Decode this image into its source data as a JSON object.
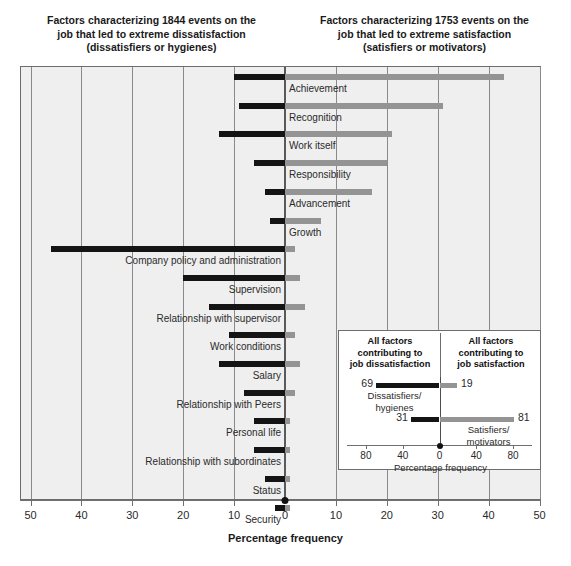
{
  "titles": {
    "left": "Factors characterizing 1844 events on the job that led to extreme dissatisfaction (dissatisfiers or hygienes)",
    "left_l1": "Factors characterizing 1844 events on the",
    "left_l2": "job that led to extreme dissatisfaction",
    "left_l3": "(dissatisfiers or hygienes)",
    "right_l1": "Factors characterizing 1753 events on the",
    "right_l2": "job that led to extreme satisfaction",
    "right_l3": "(satisfiers or motivators)"
  },
  "axis": {
    "title": "Percentage frequency",
    "ticks": [
      "50",
      "40",
      "30",
      "20",
      "10",
      "0",
      "10",
      "20",
      "30",
      "40",
      "50"
    ],
    "tick_values": [
      -50,
      -40,
      -30,
      -20,
      -10,
      0,
      10,
      20,
      30,
      40,
      50
    ]
  },
  "inset": {
    "header_left_l1": "All factors",
    "header_left_l2": "contributing to",
    "header_left_l3": "job dissatisfaction",
    "header_right_l1": "All factors",
    "header_right_l2": "contributing to",
    "header_right_l3": "job satisfaction",
    "axis_title": "Percentage frequency",
    "ticks": [
      "80",
      "40",
      "0",
      "40",
      "80"
    ],
    "tick_values": [
      -80,
      -40,
      0,
      40,
      80
    ],
    "rows": [
      {
        "caption_l1": "Dissatisfiers/",
        "caption_l2": "hygienes",
        "neg": 69,
        "pos": 19,
        "neg_label": "69",
        "pos_label": "19"
      },
      {
        "caption_l1": "Satisfiers/",
        "caption_l2": "motivators",
        "neg": 31,
        "pos": 81,
        "neg_label": "31",
        "pos_label": "81"
      }
    ]
  },
  "colors": {
    "negative_bar": "#141414",
    "positive_bar": "#949494",
    "plot_background": "#efefef",
    "frame": "#6d6d6d",
    "gridline": "#8a8a8a",
    "inset_background": "#ffffff"
  },
  "chart_data": {
    "type": "bar",
    "subtitle": "Factors characterizing 1844 events leading to extreme dissatisfaction and 1753 events leading to extreme satisfaction",
    "xlabel": "Percentage frequency",
    "ylabel": "",
    "xlim": [
      -50,
      50
    ],
    "grid": true,
    "legend_position": "none",
    "orientation": "horizontal-diverging",
    "categories": [
      "Achievement",
      "Recognition",
      "Work itself",
      "Responsibility",
      "Advancement",
      "Growth",
      "Company policy and administration",
      "Supervision",
      "Relationship with supervisor",
      "Work conditions",
      "Salary",
      "Relationship with Peers",
      "Personal life",
      "Relationship with subordinates",
      "Status",
      "Security"
    ],
    "series": [
      {
        "name": "Dissatisfaction (hygienes)",
        "color": "#141414",
        "direction": "left",
        "values": [
          10,
          9,
          13,
          6,
          4,
          3,
          46,
          20,
          15,
          11,
          13,
          8,
          6,
          6,
          4,
          2
        ]
      },
      {
        "name": "Satisfaction (motivators)",
        "color": "#949494",
        "direction": "right",
        "values": [
          43,
          31,
          21,
          20,
          17,
          7,
          2,
          3,
          4,
          2,
          3,
          2,
          1,
          1,
          1,
          1
        ]
      }
    ],
    "inset": {
      "type": "bar",
      "title_left": "All factors contributing to job dissatisfaction",
      "title_right": "All factors contributing to job satisfaction",
      "xlabel": "Percentage frequency",
      "xlim": [
        -100,
        100
      ],
      "categories": [
        "Dissatisfiers/hygienes",
        "Satisfiers/motivators"
      ],
      "series": [
        {
          "name": "Dissatisfaction",
          "direction": "left",
          "color": "#141414",
          "values": [
            69,
            31
          ]
        },
        {
          "name": "Satisfaction",
          "direction": "right",
          "color": "#949494",
          "values": [
            19,
            81
          ]
        }
      ]
    }
  },
  "rows": [
    {
      "label": "Achievement",
      "neg": 10,
      "pos": 43,
      "label_side": "right"
    },
    {
      "label": "Recognition",
      "neg": 9,
      "pos": 31,
      "label_side": "right"
    },
    {
      "label": "Work itself",
      "neg": 13,
      "pos": 21,
      "label_side": "right"
    },
    {
      "label": "Responsibility",
      "neg": 6,
      "pos": 20,
      "label_side": "right"
    },
    {
      "label": "Advancement",
      "neg": 4,
      "pos": 17,
      "label_side": "right"
    },
    {
      "label": "Growth",
      "neg": 3,
      "pos": 7,
      "label_side": "right"
    },
    {
      "label": "Company policy and administration",
      "neg": 46,
      "pos": 2,
      "label_side": "left"
    },
    {
      "label": "Supervision",
      "neg": 20,
      "pos": 3,
      "label_side": "left"
    },
    {
      "label": "Relationship with supervisor",
      "neg": 15,
      "pos": 4,
      "label_side": "left"
    },
    {
      "label": "Work conditions",
      "neg": 11,
      "pos": 2,
      "label_side": "left"
    },
    {
      "label": "Salary",
      "neg": 13,
      "pos": 3,
      "label_side": "left"
    },
    {
      "label": "Relationship with Peers",
      "neg": 8,
      "pos": 2,
      "label_side": "left"
    },
    {
      "label": "Personal life",
      "neg": 6,
      "pos": 1,
      "label_side": "left"
    },
    {
      "label": "Relationship with subordinates",
      "neg": 6,
      "pos": 1,
      "label_side": "left"
    },
    {
      "label": "Status",
      "neg": 4,
      "pos": 1,
      "label_side": "left"
    },
    {
      "label": "Security",
      "neg": 2,
      "pos": 1,
      "label_side": "left"
    }
  ]
}
